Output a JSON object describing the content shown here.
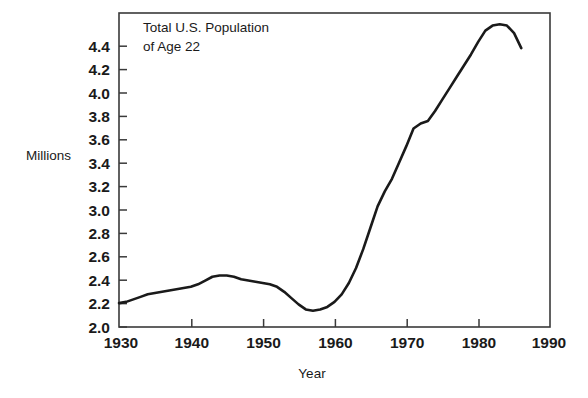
{
  "chart_data": {
    "type": "line",
    "title_line1": "Total U.S. Population",
    "title_line2": "of Age 22",
    "xlabel": "Year",
    "ylabel": "Millions",
    "xlim": [
      1930,
      1990
    ],
    "ylim": [
      2.0,
      4.5
    ],
    "grid": false,
    "legend": null,
    "x_ticks": [
      1930,
      1940,
      1950,
      1960,
      1970,
      1980,
      1990
    ],
    "x_tick_labels": [
      "1930",
      "1940",
      "1950",
      "1960",
      "1970",
      "1980",
      "1990"
    ],
    "y_ticks": [
      2.0,
      2.2,
      2.4,
      2.6,
      2.8,
      3.0,
      3.2,
      3.4,
      3.6,
      3.8,
      4.0,
      4.2,
      4.4
    ],
    "y_tick_labels": [
      "2.0",
      "2.2",
      "2.4",
      "2.6",
      "2.8",
      "3.0",
      "3.2",
      "3.4",
      "3.6",
      "3.8",
      "4.0",
      "4.2",
      "4.4"
    ],
    "series": [
      {
        "name": "Total U.S. Population of Age 22",
        "x": [
          1930,
          1931,
          1932,
          1933,
          1934,
          1935,
          1936,
          1937,
          1938,
          1939,
          1940,
          1941,
          1942,
          1943,
          1944,
          1945,
          1946,
          1947,
          1948,
          1949,
          1950,
          1951,
          1952,
          1953,
          1954,
          1955,
          1956,
          1957,
          1958,
          1959,
          1960,
          1961,
          1962,
          1963,
          1964,
          1965,
          1966,
          1967,
          1968,
          1969,
          1970,
          1971,
          1972,
          1973,
          1974,
          1975,
          1976,
          1977,
          1978,
          1979,
          1980,
          1981,
          1982,
          1983,
          1984,
          1985,
          1986
        ],
        "y": [
          2.19,
          2.2,
          2.22,
          2.24,
          2.26,
          2.27,
          2.28,
          2.29,
          2.3,
          2.31,
          2.32,
          2.34,
          2.37,
          2.4,
          2.41,
          2.41,
          2.4,
          2.38,
          2.37,
          2.36,
          2.35,
          2.34,
          2.32,
          2.28,
          2.23,
          2.18,
          2.14,
          2.13,
          2.14,
          2.16,
          2.2,
          2.26,
          2.35,
          2.47,
          2.62,
          2.79,
          2.96,
          3.08,
          3.18,
          3.31,
          3.44,
          3.58,
          3.62,
          3.64,
          3.72,
          3.81,
          3.9,
          3.99,
          4.08,
          4.17,
          4.27,
          4.36,
          4.4,
          4.41,
          4.4,
          4.34,
          4.22
        ]
      }
    ],
    "annotations": [
      {
        "text": "Total U.S. Population of Age 22",
        "position": "top-left-inside-plot"
      }
    ]
  },
  "figure": {
    "background_color": "#ffffff",
    "line_color": "#1a1a1a",
    "axis_color": "#3a3a3a"
  }
}
